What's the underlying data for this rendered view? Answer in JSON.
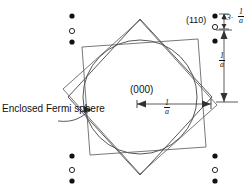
{
  "figure": {
    "type": "brillouin-zone-diagram",
    "background_color": "#ffffff",
    "line_color": "#333333",
    "text_color": "#111111"
  },
  "labels": {
    "origin": "(000)",
    "reflection_110": "(110)",
    "fermi_sphere": "Enclosed Fermi sphere",
    "delta_symbol": "δ3",
    "delta_operator": "·"
  },
  "dimensions": {
    "horizontal": {
      "numerator": "1",
      "denominator": "a"
    },
    "vertical": {
      "numerator": "1",
      "denominator": "a"
    },
    "delta_spacing": {
      "numerator": "1",
      "denominator": "a"
    }
  },
  "lattice_points": {
    "filled_marker": "filled-circle",
    "open_marker": "open-circle",
    "columns": [
      {
        "name": "left",
        "x": 72,
        "points": [
          {
            "y": 16,
            "kind": "filled"
          },
          {
            "y": 31,
            "kind": "open"
          },
          {
            "y": 42,
            "kind": "filled"
          }
        ]
      },
      {
        "name": "left-lower",
        "x": 72,
        "points": [
          {
            "y": 156,
            "kind": "filled"
          },
          {
            "y": 170,
            "kind": "open"
          },
          {
            "y": 181,
            "kind": "filled"
          }
        ]
      },
      {
        "name": "right-upper",
        "x": 215,
        "points": [
          {
            "y": 16,
            "kind": "filled"
          },
          {
            "y": 27,
            "kind": "open"
          },
          {
            "y": 41,
            "kind": "filled"
          }
        ]
      },
      {
        "name": "right-lower",
        "x": 215,
        "points": [
          {
            "y": 156,
            "kind": "filled"
          },
          {
            "y": 170,
            "kind": "open"
          },
          {
            "y": 181,
            "kind": "filled"
          }
        ]
      }
    ]
  },
  "shapes": {
    "diamond": {
      "name": "first-brillouin-zone-diamond",
      "cx": 140,
      "cy": 97,
      "rx": 72,
      "ry": 78
    },
    "square": {
      "name": "rotated-square-zone",
      "cx": 140,
      "cy": 97,
      "half": 58,
      "rotation_deg": 8
    },
    "circle": {
      "name": "fermi-sphere-circle",
      "cx": 140,
      "cy": 97,
      "r": 57
    }
  }
}
